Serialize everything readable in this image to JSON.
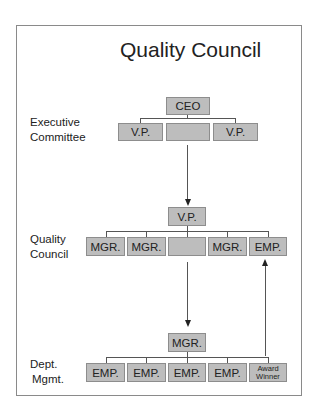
{
  "title": "Quality Council",
  "levels": {
    "executive": [
      "Executive",
      "Committee"
    ],
    "council": [
      "Quality",
      "Council"
    ],
    "dept": [
      "Dept.",
      "Mgmt."
    ]
  },
  "executive_committee": {
    "top": "CEO",
    "row": [
      "V.P.",
      "",
      "V.P."
    ]
  },
  "quality_council": {
    "top": "V.P.",
    "row": [
      "MGR.",
      "MGR.",
      "",
      "MGR.",
      "EMP."
    ]
  },
  "dept_mgmt": {
    "top": "MGR.",
    "row": [
      "EMP.",
      "EMP.",
      "EMP.",
      "EMP."
    ],
    "award": [
      "Award",
      "Winner"
    ]
  },
  "colors": {
    "box_fill": "#bdbdbd",
    "box_border": "#8d8d8d",
    "line": "#555555"
  }
}
